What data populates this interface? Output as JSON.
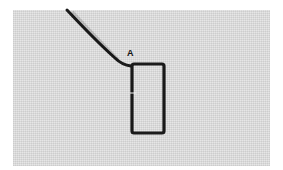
{
  "figure": {
    "label": "A",
    "colors": {
      "fabric": "#e6e6e6",
      "thread": "#1a1a1a",
      "background": "#ffffff"
    }
  }
}
